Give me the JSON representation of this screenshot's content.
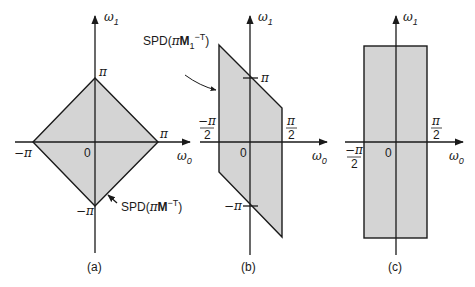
{
  "figure": {
    "shade_color": "#d4d4d4",
    "line_color": "#1a1a1a",
    "panels": [
      {
        "id": "a",
        "caption": "(a)",
        "axis_x_label": "ω",
        "axis_x_sub": "0",
        "axis_y_label": "ω",
        "axis_y_sub": "1",
        "origin_label": "0",
        "region_shape": "diamond",
        "tick_labels": {
          "top": "π",
          "right": "π",
          "left": "−π",
          "bottom": "−π"
        },
        "annotation": {
          "prefix": "SPD(",
          "pi": "π",
          "matrix": "M",
          "matrix_sub": "",
          "exponent": "−T",
          "suffix": ")"
        }
      },
      {
        "id": "b",
        "caption": "(b)",
        "axis_x_label": "ω",
        "axis_x_sub": "0",
        "axis_y_label": "ω",
        "axis_y_sub": "1",
        "origin_label": "0",
        "region_shape": "parallelogram",
        "tick_labels": {
          "top": "π",
          "bottom": "−π",
          "left_num": "−π",
          "left_den": "2",
          "right_num": "π",
          "right_den": "2"
        },
        "annotation": {
          "prefix": "SPD(",
          "pi": "π",
          "matrix": "M",
          "matrix_sub": "1",
          "exponent": "−T",
          "suffix": ")"
        }
      },
      {
        "id": "c",
        "caption": "(c)",
        "axis_x_label": "ω",
        "axis_x_sub": "0",
        "axis_y_label": "ω",
        "axis_y_sub": "1",
        "origin_label": "0",
        "region_shape": "rectangle",
        "tick_labels": {
          "left_num": "−π",
          "left_den": "2",
          "right_num": "π",
          "right_den": "2"
        }
      }
    ]
  }
}
